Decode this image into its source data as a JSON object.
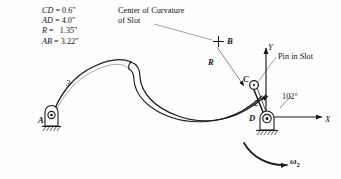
{
  "figure": {
    "background_color": "#fefefe",
    "line_color": "#1a1a1a",
    "leader_color": "#8c8c8c"
  },
  "dimensions": {
    "items": [
      {
        "name": "CD",
        "eq": "=",
        "value": "0.6\""
      },
      {
        "name": "AD",
        "eq": "=",
        "value": "4.0\""
      },
      {
        "name": "R",
        "eq": "=",
        "value": "1.35\""
      },
      {
        "name": "AB",
        "eq": "=",
        "value": "3.22\""
      }
    ]
  },
  "annotations": {
    "center_of_curvature_line1": "Center of Curvature",
    "center_of_curvature_line2": "of Slot",
    "pin_in_slot": "Pin in Slot",
    "angle": "102°"
  },
  "points": {
    "A": "A",
    "B": "B",
    "C": "C",
    "D": "D",
    "R": "R"
  },
  "links": {
    "link3": "3",
    "link2": "2"
  },
  "axes": {
    "x": "X",
    "y": "Y"
  },
  "motion": {
    "omega_symbol": "ω",
    "omega_subscript": "2"
  }
}
